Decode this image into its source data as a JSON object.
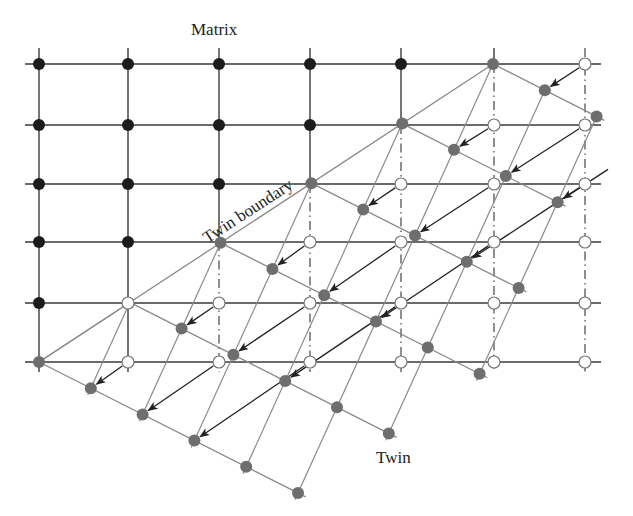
{
  "labels": {
    "matrix": "Matrix",
    "twin_boundary": "Twin boundary",
    "twin": "Twin"
  },
  "colors": {
    "matrix_node": "#1c1c1c",
    "twin_node": "#6e6e6e",
    "vacant_node_fill": "#ffffff",
    "vacant_node_stroke": "#777777",
    "matrix_line": "#3a3a3a",
    "twin_line": "#8a8a8a",
    "arrow": "#222222",
    "dashed_line": "#555555"
  },
  "lattice": {
    "origin": [
      39,
      362
    ],
    "matrix_a": [
      91,
      0
    ],
    "matrix_b": [
      0,
      -59.8
    ],
    "twin_u": [
      51.8,
      26.2
    ],
    "twin_v": [
      39,
      -85.8
    ],
    "columns": 7,
    "rows": 6,
    "h_line_x_range": [
      25,
      601
    ],
    "v_line_y_range": [
      48,
      372
    ],
    "node_radius": 6
  },
  "matrix_grid": {
    "row_y": [
      362,
      303,
      242,
      184,
      125,
      64
    ],
    "col_x": [
      39,
      128,
      219,
      310,
      401,
      494,
      585
    ]
  },
  "twin_rows": [
    {
      "r": 0,
      "c_from": 0,
      "c_to": 5
    },
    {
      "r": 1,
      "c_from": 1,
      "c_to": 6
    },
    {
      "r": 2,
      "c_from": 2,
      "c_to": 7
    },
    {
      "r": 3,
      "c_from": 3,
      "c_to": 7
    },
    {
      "r": 4,
      "c_from": 4,
      "c_to": 7
    },
    {
      "r": 5,
      "c_from": 5,
      "c_to": 7
    }
  ],
  "twin_columns": [
    {
      "c": 1,
      "r_from": 0,
      "r_to": 1
    },
    {
      "c": 2,
      "r_from": 0,
      "r_to": 2
    },
    {
      "c": 3,
      "r_from": 0,
      "r_to": 3
    },
    {
      "c": 4,
      "r_from": 0,
      "r_to": 4
    },
    {
      "c": 5,
      "r_from": 0,
      "r_to": 5
    },
    {
      "c": 6,
      "r_from": 1,
      "r_to": 5
    },
    {
      "c": 7,
      "r_from": 2,
      "r_to": 5
    }
  ],
  "arrows": [
    [
      1,
      0
    ],
    [
      2,
      0
    ],
    [
      3,
      0
    ],
    [
      2,
      1
    ],
    [
      3,
      1
    ],
    [
      4,
      1
    ],
    [
      3,
      2
    ],
    [
      4,
      2
    ],
    [
      5,
      2
    ],
    [
      4,
      3
    ],
    [
      5,
      3
    ],
    [
      6,
      3
    ],
    [
      5,
      4
    ],
    [
      6,
      4
    ],
    [
      7,
      4
    ],
    [
      6,
      5
    ]
  ],
  "legend_semantics": {
    "black_nodes": "matrix atoms",
    "gray_nodes": "twin atoms",
    "open_nodes": "original matrix sites vacated by twinning",
    "arrows": "atomic displacement during twinning"
  }
}
